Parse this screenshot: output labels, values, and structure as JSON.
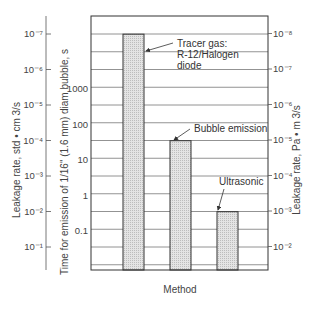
{
  "chart_data": {
    "type": "bar",
    "title": "",
    "xlabel": "Method",
    "categories": [
      "Tracer gas: R-12/Halogen diode",
      "Bubble emission",
      "Ultrasonic"
    ],
    "annotations": [
      {
        "lines": [
          "Tracer gas:",
          "R-12/Halogen",
          "diode"
        ],
        "category": 0
      },
      {
        "lines": [
          "Bubble emission"
        ],
        "category": 1
      },
      {
        "lines": [
          "Ultrasonic"
        ],
        "category": 2
      }
    ],
    "series": [
      {
        "name": "Time for emission of 1/16\" (1.6 mm) diam bubble, s",
        "values": [
          35000,
          35,
          0.35
        ]
      },
      {
        "name": "Leakage rate, std • cm 3/s",
        "values": [
          1e-07,
          0.0001,
          0.01
        ]
      },
      {
        "name": "Leakage rate, Pa • m 3/s",
        "values": [
          1e-08,
          1e-05,
          0.001
        ]
      }
    ],
    "axes": {
      "left_outer": {
        "label": "Leakage rate, std • cm 3/s",
        "scale": "log",
        "ticks": [
          {
            "label": "10⁻⁷",
            "value": 1e-07
          },
          {
            "label": "10⁻⁶",
            "value": 1e-06
          },
          {
            "label": "10⁻⁵",
            "value": 1e-05
          },
          {
            "label": "10⁻⁴",
            "value": 0.0001
          },
          {
            "label": "10⁻³",
            "value": 0.001
          },
          {
            "label": "10⁻²",
            "value": 0.01
          },
          {
            "label": "10⁻¹",
            "value": 0.1
          }
        ],
        "direction": "increasing-downward"
      },
      "left_inner": {
        "label": "Time for emission of 1/16\" (1.6 mm) diam bubble, s",
        "scale": "log",
        "ticks": [
          {
            "label": "1000",
            "value": 1000
          },
          {
            "label": "100",
            "value": 100
          },
          {
            "label": "10",
            "value": 10
          },
          {
            "label": "1",
            "value": 1
          },
          {
            "label": "0.1",
            "value": 0.1
          }
        ],
        "range": [
          0.01,
          100000
        ]
      },
      "right": {
        "label": "Leakage rate, Pa • m 3/s",
        "scale": "log",
        "ticks": [
          {
            "label": "10⁻⁸",
            "value": 1e-08
          },
          {
            "label": "10⁻⁷",
            "value": 1e-07
          },
          {
            "label": "10⁻⁶",
            "value": 1e-06
          },
          {
            "label": "10⁻⁵",
            "value": 1e-05
          },
          {
            "label": "10⁻⁴",
            "value": 0.0001
          },
          {
            "label": "10⁻³",
            "value": 0.001
          },
          {
            "label": "10⁻²",
            "value": 0.01
          }
        ],
        "direction": "increasing-downward"
      }
    },
    "grid": true,
    "legend": "none",
    "colors": {
      "bar_fill": "#d9d9d9",
      "bar_stroke": "#333333",
      "grid": "#777777",
      "frame": "#333333"
    }
  }
}
